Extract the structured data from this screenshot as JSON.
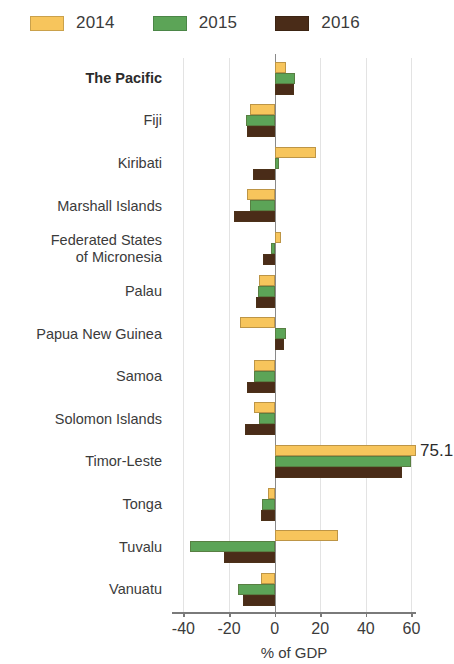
{
  "legend": {
    "entries": [
      {
        "label": "2014",
        "color": "#F7C55C"
      },
      {
        "label": "2015",
        "color": "#5CA457"
      },
      {
        "label": "2016",
        "color": "#4A2C18"
      }
    ]
  },
  "axis": {
    "x_title": "% of GDP",
    "ticks": [
      "-40",
      "-20",
      "0",
      "20",
      "40",
      "60"
    ]
  },
  "annotations": [
    {
      "text": "75.1",
      "category": "Timor-Leste",
      "series": "2014"
    }
  ],
  "chart_data": {
    "type": "bar",
    "orientation": "horizontal",
    "title": "",
    "subtitle": "",
    "xlabel": "% of GDP",
    "ylabel": "",
    "xlim": [
      -45,
      62
    ],
    "xticks": [
      -40,
      -20,
      0,
      20,
      40,
      60
    ],
    "grid": true,
    "legend_position": "top-left",
    "categories": [
      "The Pacific",
      "Fiji",
      "Kiribati",
      "Marshall Islands",
      "Federated States of Micronesia",
      "Palau",
      "Papua New Guinea",
      "Samoa",
      "Solomon Islands",
      "Timor-Leste",
      "Tonga",
      "Tuvalu",
      "Vanuatu"
    ],
    "category_display": [
      "The Pacific",
      "Fiji",
      "Kiribati",
      "Marshall Islands",
      "Federated States\nof Micronesia",
      "Palau",
      "Papua New Guinea",
      "Samoa",
      "Solomon Islands",
      "Timor-Leste",
      "Tonga",
      "Tuvalu",
      "Vanuatu"
    ],
    "series": [
      {
        "name": "2014",
        "color": "#F7C55C",
        "values": [
          5.0,
          -11.0,
          18.0,
          -12.0,
          3.0,
          -7.0,
          -15.0,
          -9.0,
          -9.0,
          75.1,
          -3.0,
          28.0,
          -6.0
        ]
      },
      {
        "name": "2015",
        "color": "#5CA457",
        "values": [
          9.0,
          -12.5,
          2.0,
          -11.0,
          -1.5,
          -7.5,
          5.0,
          -9.0,
          -7.0,
          60.0,
          -5.5,
          -37.0,
          -16.0
        ]
      },
      {
        "name": "2016",
        "color": "#4A2C18",
        "values": [
          8.5,
          -12.0,
          -9.5,
          -18.0,
          -5.0,
          -8.0,
          4.0,
          -12.0,
          -13.0,
          56.0,
          -6.0,
          -22.0,
          -14.0
        ]
      }
    ],
    "clipped_values": [
      {
        "category": "Timor-Leste",
        "series": "2014",
        "value": 75.1,
        "label": "75.1"
      }
    ]
  }
}
